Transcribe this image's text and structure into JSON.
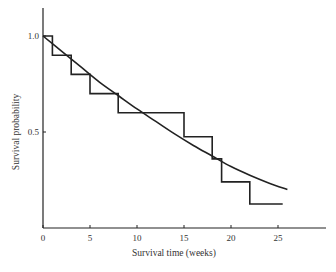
{
  "chart_data": {
    "type": "line",
    "title": "",
    "xlabel": "Survival time (weeks)",
    "ylabel": "Survival probability",
    "xlim": [
      0,
      30
    ],
    "ylim": [
      0,
      1.15
    ],
    "x_ticks": [
      0,
      5,
      10,
      15,
      20,
      25
    ],
    "x_tick_labels": [
      "0",
      "5",
      "10",
      "15",
      "20",
      "25"
    ],
    "y_ticks": [
      0.5,
      1.0
    ],
    "y_tick_labels": [
      "0.5",
      "1.0"
    ],
    "grid": false,
    "legend": null,
    "series": [
      {
        "name": "Kaplan-Meier estimate",
        "style": "step",
        "x": [
          0,
          1,
          3,
          5,
          8,
          15,
          18,
          19,
          22,
          25.5
        ],
        "y": [
          1.0,
          0.9,
          0.8,
          0.7,
          0.6,
          0.475,
          0.36,
          0.24,
          0.125,
          0.125
        ]
      },
      {
        "name": "Fitted survival curve",
        "style": "smooth",
        "x": [
          0,
          2,
          4,
          6,
          8,
          10,
          12,
          14,
          16,
          18,
          20,
          22,
          24,
          26
        ],
        "y": [
          1.0,
          0.92,
          0.84,
          0.76,
          0.69,
          0.62,
          0.555,
          0.49,
          0.43,
          0.375,
          0.32,
          0.275,
          0.235,
          0.2
        ]
      }
    ]
  }
}
